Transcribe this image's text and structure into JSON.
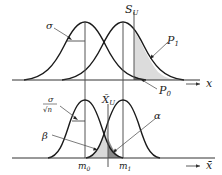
{
  "top_panel": {
    "axis_label": "x",
    "threshold_label": "S",
    "threshold_sub": "U",
    "sigma_label": "σ",
    "p1_label": "P",
    "p1_sub": "1",
    "p0_label": "P",
    "p0_sub": "0"
  },
  "bottom_panel": {
    "axis_label": "x̄",
    "threshold_label": "X̄",
    "threshold_sub": "U",
    "sigma_num": "σ",
    "sigma_den": "√n",
    "alpha_label": "α",
    "beta_label": "β",
    "m0_label": "m",
    "m0_sub": "0",
    "m1_label": "m",
    "m1_sub": "1"
  },
  "colors": {
    "curve": "#1a1a1a",
    "shade_light": "#d9d9d9",
    "shade_dark": "#8a8a8a",
    "guide": "#555555"
  }
}
